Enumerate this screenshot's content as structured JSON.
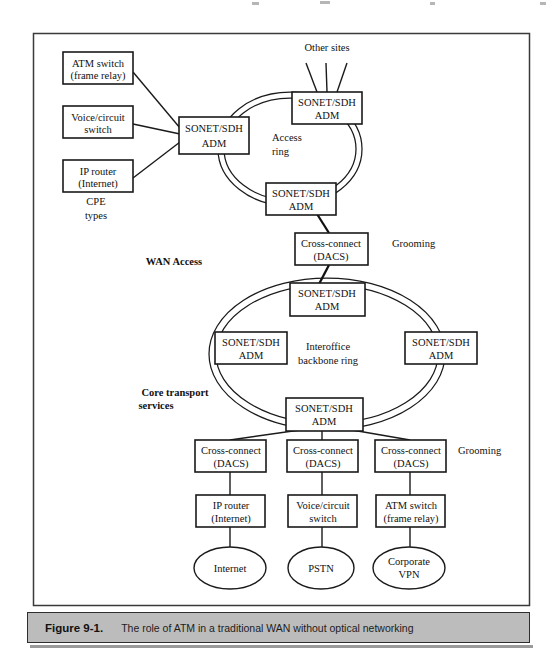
{
  "figure": {
    "caption_number": "Figure 9-1.",
    "caption_text": "The role of ATM in a traditional WAN without optical networking"
  },
  "nodes": {
    "cpe_atm_switch": {
      "line1": "ATM switch",
      "line2": "(frame relay)"
    },
    "cpe_voice_switch": {
      "line1": "Voice/circuit",
      "line2": "switch"
    },
    "cpe_ip_router": {
      "line1": "IP router",
      "line2": "(Internet)"
    },
    "access_adm_left": {
      "line1": "SONET/SDH",
      "line2": "ADM"
    },
    "access_adm_top": {
      "line1": "SONET/SDH",
      "line2": "ADM"
    },
    "access_adm_bottom": {
      "line1": "SONET/SDH",
      "line2": "ADM"
    },
    "dacs_mid": {
      "line1": "Cross-connect",
      "line2": "(DACS)"
    },
    "backbone_adm_top": {
      "line1": "SONET/SDH",
      "line2": "ADM"
    },
    "backbone_adm_left": {
      "line1": "SONET/SDH",
      "line2": "ADM"
    },
    "backbone_adm_right": {
      "line1": "SONET/SDH",
      "line2": "ADM"
    },
    "backbone_adm_bottom": {
      "line1": "SONET/SDH",
      "line2": "ADM"
    },
    "dacs_left": {
      "line1": "Cross-connect",
      "line2": "(DACS)"
    },
    "dacs_center": {
      "line1": "Cross-connect",
      "line2": "(DACS)"
    },
    "dacs_right": {
      "line1": "Cross-connect",
      "line2": "(DACS)"
    },
    "svc_ip_router": {
      "line1": "IP router",
      "line2": "(Internet)"
    },
    "svc_voice_switch": {
      "line1": "Voice/circuit",
      "line2": "switch"
    },
    "svc_atm_switch": {
      "line1": "ATM switch",
      "line2": "(frame relay)"
    },
    "cloud_internet": {
      "line1": "Internet",
      "line2": ""
    },
    "cloud_pstn": {
      "line1": "PSTN",
      "line2": ""
    },
    "cloud_vpn": {
      "line1": "Corporate",
      "line2": "VPN"
    }
  },
  "labels": {
    "other_sites": "Other sites",
    "access_ring_l1": "Access",
    "access_ring_l2": "ring",
    "cpe_types_l1": "CPE",
    "cpe_types_l2": "types",
    "wan_access": "WAN Access",
    "grooming_top": "Grooming",
    "grooming_bottom": "Grooming",
    "interoffice_l1": "Interoffice",
    "interoffice_l2": "backbone ring",
    "core_transport_l1": "Core transport",
    "core_transport_l2": "services"
  },
  "colors": {
    "stroke": "#1a1a1a",
    "caption_bg": "#bcbcbc",
    "frame": "#3a3a3a",
    "page_bg": "#ffffff"
  }
}
